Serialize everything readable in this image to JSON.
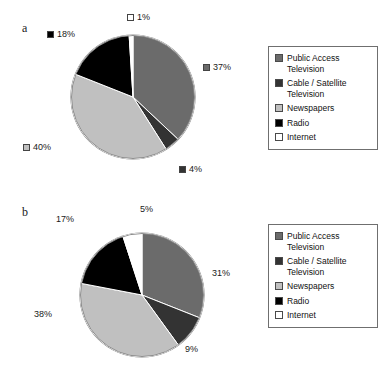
{
  "figure": {
    "panels": [
      {
        "letter": "a",
        "chart_data": {
          "type": "pie",
          "title": "",
          "start_angle_deg": 0,
          "direction": "clockwise",
          "labels": [
            "Public Access Television",
            "Cable / Satellite Television",
            "Newspapers",
            "Radio",
            "Internet"
          ],
          "values": [
            37,
            4,
            40,
            18,
            1
          ],
          "value_labels": [
            "37%",
            "4%",
            "40%",
            "18%",
            "1%"
          ],
          "colors": [
            "#6b6b6b",
            "#333333",
            "#c0c0c0",
            "#000000",
            "#ffffff"
          ],
          "labels_have_swatch": true,
          "legend_position": "right"
        }
      },
      {
        "letter": "b",
        "chart_data": {
          "type": "pie",
          "title": "",
          "start_angle_deg": 0,
          "direction": "clockwise",
          "labels": [
            "Public Access Television",
            "Cable / Satellite Television",
            "Newspapers",
            "Radio",
            "Internet"
          ],
          "values": [
            31,
            9,
            38,
            17,
            5
          ],
          "value_labels": [
            "31%",
            "9%",
            "38%",
            "17%",
            "5%"
          ],
          "colors": [
            "#6b6b6b",
            "#333333",
            "#c0c0c0",
            "#000000",
            "#ffffff"
          ],
          "labels_have_swatch": false,
          "legend_position": "right"
        }
      }
    ],
    "legend": {
      "items": [
        {
          "label": "Public Access Television",
          "color": "#6b6b6b"
        },
        {
          "label": "Cable / Satellite Television",
          "color": "#333333"
        },
        {
          "label": "Newspapers",
          "color": "#c0c0c0"
        },
        {
          "label": "Radio",
          "color": "#000000"
        },
        {
          "label": "Internet",
          "color": "#ffffff"
        }
      ]
    }
  }
}
